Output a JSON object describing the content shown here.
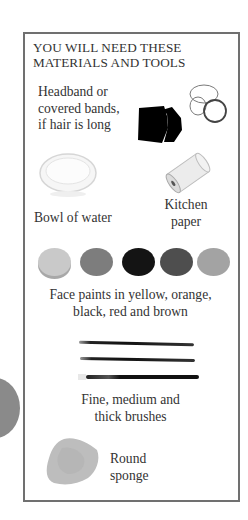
{
  "panel": {
    "title_line1": "YOU WILL NEED THESE",
    "title_line2": "MATERIALS AND TOOLS"
  },
  "items": [
    {
      "id": "headband",
      "lines": [
        "Headband or",
        "covered bands,",
        "if hair is long"
      ],
      "icon": "headband-and-bands-icon"
    },
    {
      "id": "bowl",
      "lines": [
        "Bowl of water"
      ],
      "icon": "bowl-of-water-icon"
    },
    {
      "id": "kitchen_paper",
      "lines": [
        "Kitchen",
        "paper"
      ],
      "icon": "kitchen-paper-roll-icon"
    },
    {
      "id": "face_paints",
      "lines": [
        "Face paints in yellow, orange,",
        "black, red and brown"
      ],
      "icon": "face-paint-swatches-icon"
    },
    {
      "id": "brushes",
      "lines": [
        "Fine, medium and",
        "thick brushes"
      ],
      "icon": "paint-brushes-icon"
    },
    {
      "id": "sponge",
      "lines": [
        "Round",
        "sponge"
      ],
      "icon": "round-sponge-icon"
    }
  ],
  "paint_swatches": [
    {
      "name": "yellow",
      "color": "#c9c9c9"
    },
    {
      "name": "orange",
      "color": "#7d7d7d"
    },
    {
      "name": "black",
      "color": "#141414"
    },
    {
      "name": "red",
      "color": "#4e4e4e"
    },
    {
      "name": "brown",
      "color": "#a3a3a3"
    }
  ],
  "colors": {
    "frame_border": "#707070",
    "text": "#333333"
  }
}
